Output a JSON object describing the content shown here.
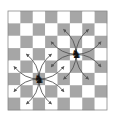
{
  "diagram": {
    "type": "chessboard",
    "size": 8,
    "top_left_square": "light",
    "colors": {
      "light": "#ffffff",
      "dark": "#a6a6a6",
      "arrow": "#555555",
      "piece": "#111111"
    },
    "pieces": [
      {
        "name": "knight",
        "glyph": "♞",
        "col": 2,
        "row": 5
      },
      {
        "name": "knight",
        "glyph": "♞",
        "col": 5,
        "row": 3
      }
    ],
    "arrows": [
      {
        "from": [
          2,
          5
        ],
        "to": [
          0,
          4
        ]
      },
      {
        "from": [
          2,
          5
        ],
        "to": [
          0,
          6
        ]
      },
      {
        "from": [
          2,
          5
        ],
        "to": [
          1,
          3
        ]
      },
      {
        "from": [
          2,
          5
        ],
        "to": [
          1,
          7
        ]
      },
      {
        "from": [
          2,
          5
        ],
        "to": [
          3,
          3
        ]
      },
      {
        "from": [
          2,
          5
        ],
        "to": [
          3,
          7
        ]
      },
      {
        "from": [
          2,
          5
        ],
        "to": [
          4,
          4
        ]
      },
      {
        "from": [
          2,
          5
        ],
        "to": [
          4,
          6
        ]
      },
      {
        "from": [
          5,
          3
        ],
        "to": [
          3,
          2
        ]
      },
      {
        "from": [
          5,
          3
        ],
        "to": [
          3,
          4
        ]
      },
      {
        "from": [
          5,
          3
        ],
        "to": [
          4,
          1
        ]
      },
      {
        "from": [
          5,
          3
        ],
        "to": [
          4,
          5
        ]
      },
      {
        "from": [
          5,
          3
        ],
        "to": [
          6,
          1
        ]
      },
      {
        "from": [
          5,
          3
        ],
        "to": [
          6,
          5
        ]
      },
      {
        "from": [
          5,
          3
        ],
        "to": [
          7,
          2
        ]
      },
      {
        "from": [
          5,
          3
        ],
        "to": [
          7,
          4
        ]
      }
    ]
  }
}
